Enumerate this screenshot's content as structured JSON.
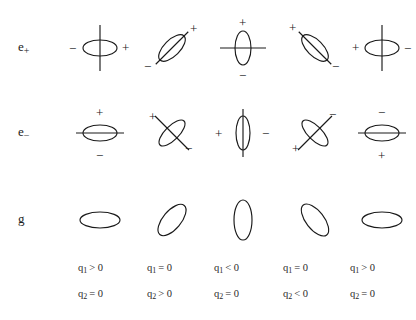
{
  "figure": {
    "title": "",
    "rows": [
      {
        "id": "e-plus",
        "label_base": "e",
        "label_sub": "+",
        "cells": [
          {
            "name": "e-plus-col-1",
            "ellipse": {
              "rx": 17,
              "ry": 8,
              "rotation": 0
            },
            "line": {
              "angle": 90,
              "length": 46
            },
            "signs": [
              {
                "text": "−",
                "x": -31,
                "y": -6
              },
              {
                "text": "+",
                "x": 22,
                "y": -7
              }
            ]
          },
          {
            "name": "e-plus-col-2",
            "ellipse": {
              "rx": 17,
              "ry": 8,
              "rotation": -45
            },
            "line": {
              "angle": 45,
              "length": 46
            },
            "signs": [
              {
                "text": "+",
                "x": 18,
                "y": -26
              },
              {
                "text": "−",
                "x": -28,
                "y": 12
              }
            ]
          },
          {
            "name": "e-plus-col-3",
            "ellipse": {
              "rx": 8,
              "ry": 17,
              "rotation": 0
            },
            "line": {
              "angle": 0,
              "length": 46
            },
            "signs": [
              {
                "text": "+",
                "x": -4,
                "y": -32
              },
              {
                "text": "−",
                "x": -4,
                "y": 21
              }
            ]
          },
          {
            "name": "e-plus-col-4",
            "ellipse": {
              "rx": 17,
              "ry": 8,
              "rotation": 45
            },
            "line": {
              "angle": -45,
              "length": 46
            },
            "signs": [
              {
                "text": "+",
                "x": -26,
                "y": -27
              },
              {
                "text": "−",
                "x": 17,
                "y": 12
              }
            ]
          },
          {
            "name": "e-plus-col-5",
            "ellipse": {
              "rx": 17,
              "ry": 8,
              "rotation": 0
            },
            "line": {
              "angle": 90,
              "length": 46
            },
            "signs": [
              {
                "text": "+",
                "x": -30,
                "y": -7
              },
              {
                "text": "−",
                "x": 22,
                "y": -6
              }
            ]
          }
        ]
      },
      {
        "id": "e-minus",
        "label_base": "e",
        "label_sub": "−",
        "cells": [
          {
            "name": "e-minus-col-1",
            "ellipse": {
              "rx": 17,
              "ry": 8,
              "rotation": 0
            },
            "line": {
              "angle": 0,
              "length": 48
            },
            "signs": [
              {
                "text": "+",
                "x": -4,
                "y": -27
              },
              {
                "text": "−",
                "x": -4,
                "y": 16
              }
            ]
          },
          {
            "name": "e-minus-col-2",
            "ellipse": {
              "rx": 17,
              "ry": 7,
              "rotation": -45
            },
            "line": {
              "angle": -45,
              "length": 48
            },
            "signs": [
              {
                "text": "+",
                "x": -23,
                "y": -23
              },
              {
                "text": "−",
                "x": 13,
                "y": 9
              }
            ]
          },
          {
            "name": "e-minus-col-3",
            "ellipse": {
              "rx": 7,
              "ry": 17,
              "rotation": 0
            },
            "line": {
              "angle": 90,
              "length": 48
            },
            "signs": [
              {
                "text": "+",
                "x": -28,
                "y": -6
              },
              {
                "text": "−",
                "x": 19,
                "y": -6
              }
            ]
          },
          {
            "name": "e-minus-col-4",
            "ellipse": {
              "rx": 17,
              "ry": 7,
              "rotation": 45
            },
            "line": {
              "angle": 45,
              "length": 48
            },
            "signs": [
              {
                "text": "−",
                "x": 14,
                "y": -25
              },
              {
                "text": "+",
                "x": -23,
                "y": 9
              }
            ]
          },
          {
            "name": "e-minus-col-5",
            "ellipse": {
              "rx": 17,
              "ry": 8,
              "rotation": 0
            },
            "line": {
              "angle": 0,
              "length": 48
            },
            "signs": [
              {
                "text": "−",
                "x": -4,
                "y": -27
              },
              {
                "text": "+",
                "x": -4,
                "y": 16
              }
            ]
          }
        ]
      },
      {
        "id": "g",
        "label_base": "g",
        "label_sub": "",
        "cells": [
          {
            "name": "g-col-1",
            "ellipse": {
              "rx": 20,
              "ry": 8,
              "rotation": 0
            },
            "line": null,
            "signs": []
          },
          {
            "name": "g-col-2",
            "ellipse": {
              "rx": 19,
              "ry": 9,
              "rotation": -50
            },
            "line": null,
            "signs": []
          },
          {
            "name": "g-col-3",
            "ellipse": {
              "rx": 9,
              "ry": 20,
              "rotation": 0
            },
            "line": null,
            "signs": []
          },
          {
            "name": "g-col-4",
            "ellipse": {
              "rx": 19,
              "ry": 9,
              "rotation": 52
            },
            "line": null,
            "signs": []
          },
          {
            "name": "g-col-5",
            "ellipse": {
              "rx": 20,
              "ry": 8,
              "rotation": 0
            },
            "line": null,
            "signs": []
          }
        ]
      }
    ],
    "columns": [
      {
        "q1": "q",
        "q1_sub": "1",
        "q1_rel": "> 0",
        "q2": "q",
        "q2_sub": "2",
        "q2_rel": "= 0"
      },
      {
        "q1": "q",
        "q1_sub": "1",
        "q1_rel": "= 0",
        "q2": "q",
        "q2_sub": "2",
        "q2_rel": "> 0"
      },
      {
        "q1": "q",
        "q1_sub": "1",
        "q1_rel": "< 0",
        "q2": "q",
        "q2_sub": "2",
        "q2_rel": "= 0"
      },
      {
        "q1": "q",
        "q1_sub": "1",
        "q1_rel": "= 0",
        "q2": "q",
        "q2_sub": "2",
        "q2_rel": "< 0"
      },
      {
        "q1": "q",
        "q1_sub": "1",
        "q1_rel": "> 0",
        "q2": "q",
        "q2_sub": "2",
        "q2_rel": "= 0"
      }
    ],
    "colors": {
      "stroke": "#1a1a1a",
      "background": "#ffffff",
      "text": "#2a2a2a"
    },
    "geometry": {
      "row_y": [
        48,
        133,
        220
      ],
      "label_x": 18,
      "col_x": [
        100,
        172,
        243,
        315,
        382
      ],
      "q1_y": 262,
      "q2_y": 288,
      "q_x": [
        78,
        147,
        214,
        283,
        350
      ]
    }
  }
}
